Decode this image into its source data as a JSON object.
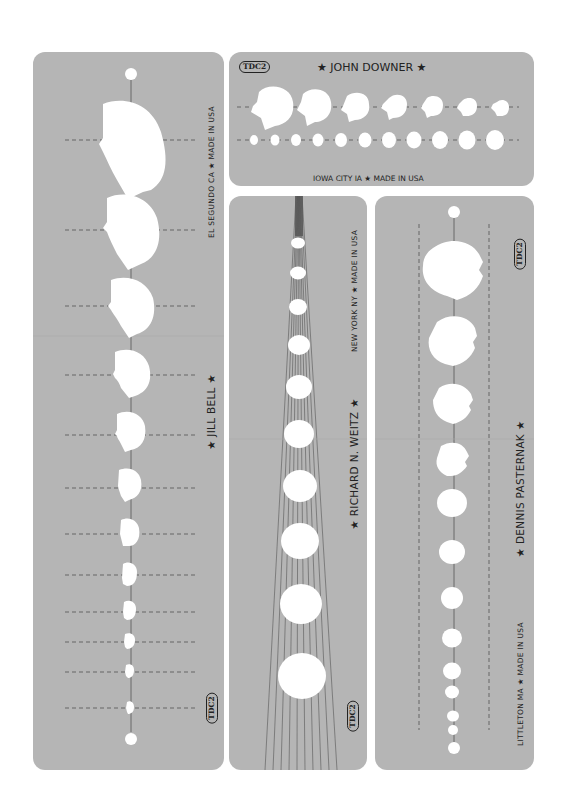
{
  "colors": {
    "background": "#ffffff",
    "panel": "#b5b5b5",
    "ink": "#222222",
    "cutout": "#ffffff"
  },
  "templates": {
    "jill_bell": {
      "name": "★ JILL BELL ★",
      "origin": "EL SEGUNDO CA ★ MADE IN USA",
      "badge": "TDC2",
      "head_count": 12
    },
    "john_downer": {
      "name": "★ JOHN DOWNER ★",
      "origin": "IOWA CITY IA ★ MADE IN USA",
      "badge": "TDC2",
      "row1_head_count": 7,
      "row2_head_count": 11
    },
    "richard_weitz": {
      "name": "★ RICHARD N. WEITZ ★",
      "origin": "NEW YORK NY ★ MADE IN USA",
      "badge": "TDC2",
      "head_count": 10
    },
    "dennis_pasternak": {
      "name": "★ DENNIS PASTERNAK ★",
      "origin": "LITTLETON MA ★ MADE IN USA",
      "badge": "TDC2",
      "head_count": 12
    }
  }
}
